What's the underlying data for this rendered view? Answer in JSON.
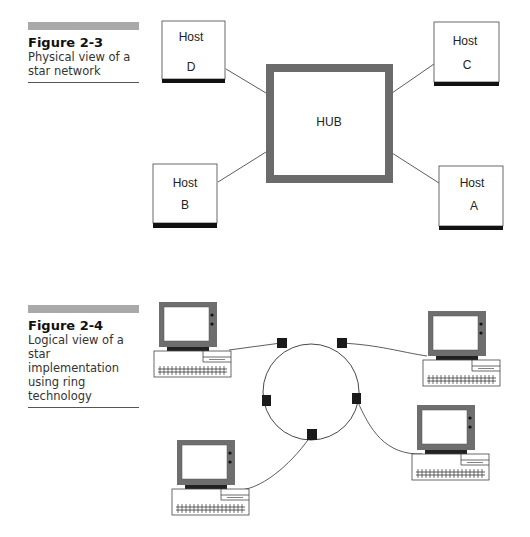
{
  "figure_2_3": {
    "number": "Figure 2-3",
    "caption": "Physical view of a star network",
    "hub": {
      "label": "HUB"
    },
    "hosts": [
      {
        "line1": "Host",
        "line2": "D"
      },
      {
        "line1": "Host",
        "line2": "C"
      },
      {
        "line1": "Host",
        "line2": "B"
      },
      {
        "line1": "Host",
        "line2": "A"
      }
    ]
  },
  "figure_2_4": {
    "number": "Figure 2-4",
    "caption": "Logical view of a star implementation using ring technology",
    "ring_nodes": 6,
    "computers": 4
  },
  "colors": {
    "hub_border": "#6b6b6b",
    "caption_bar": "#a9a9a9",
    "monitor": "#6e6e6e",
    "node": "#1a1a1a"
  }
}
